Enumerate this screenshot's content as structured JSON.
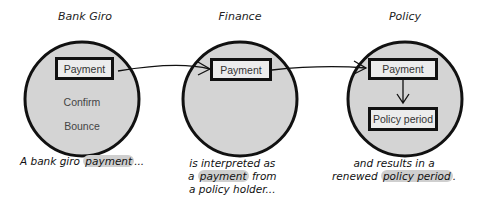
{
  "contexts": [
    {
      "title": "Bank Giro",
      "boxes": [
        "Payment"
      ],
      "items": [
        "Confirm",
        "Bounce"
      ],
      "caption": {
        "pre": "A bank giro ",
        "highlight": "payment",
        "post": "..."
      }
    },
    {
      "title": "Finance",
      "boxes": [
        "Payment"
      ],
      "caption": {
        "line1": "is interpreted as",
        "line2_pre": "a ",
        "line2_highlight": "payment",
        "line2_post": " from",
        "line3": "a policy holder..."
      }
    },
    {
      "title": "Policy",
      "boxes": [
        "Payment",
        "Policy period"
      ],
      "caption": {
        "line1": "and results in a",
        "line2_pre": "renewed ",
        "line2_highlight": "policy period",
        "line2_post": "."
      }
    }
  ],
  "colors": {
    "circle_fill": "#d4d4d4",
    "stroke": "#111111",
    "box_fill": "#ececec",
    "highlight": "#cfcfcf"
  }
}
